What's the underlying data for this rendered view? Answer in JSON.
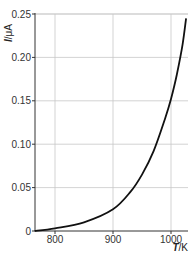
{
  "chart_data": {
    "type": "line",
    "title": "",
    "xlabel": "T/K",
    "ylabel": "I/μA",
    "xlim": [
      765,
      1030
    ],
    "ylim": [
      0,
      0.25
    ],
    "x_ticks": [
      "800",
      "900",
      "1000"
    ],
    "y_ticks": [
      "0",
      "0.05",
      "0.10",
      "0.15",
      "0.20",
      "0.25"
    ],
    "grid": true,
    "legend": null,
    "series": [
      {
        "name": "I vs T",
        "x": [
          765,
          800,
          850,
          900,
          930,
          950,
          970,
          990,
          1000,
          1010,
          1020,
          1026
        ],
        "values": [
          0.0,
          0.003,
          0.01,
          0.025,
          0.045,
          0.065,
          0.092,
          0.13,
          0.152,
          0.18,
          0.215,
          0.245
        ]
      }
    ]
  },
  "axis": {
    "y_label_main": "I",
    "y_label_unit": "/μA",
    "x_label_main": "T",
    "x_label_unit": "/K"
  }
}
